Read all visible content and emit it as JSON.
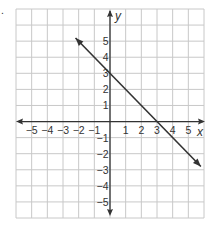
{
  "problem_marker": ".",
  "chart_data": {
    "type": "line",
    "title": "",
    "xlabel": "x",
    "ylabel": "y",
    "xlim": [
      -6,
      6
    ],
    "ylim": [
      -6,
      7
    ],
    "grid": true,
    "x_ticks": [
      -5,
      -4,
      -3,
      -2,
      -1,
      1,
      2,
      3,
      4,
      5
    ],
    "y_ticks": [
      -5,
      -4,
      -3,
      -2,
      -1,
      1,
      2,
      3,
      4,
      5
    ],
    "x_tick_labels": [
      "−5",
      "−4",
      "−3",
      "−2",
      "−1",
      "1",
      "2",
      "3",
      "4",
      "5"
    ],
    "y_tick_labels": [
      "5",
      "4",
      "3",
      "2",
      "1",
      "−1",
      "−2",
      "−3",
      "−4",
      "−5"
    ],
    "series": [
      {
        "name": "line",
        "equation": "y = -x + 3",
        "slope": -1,
        "y_intercept": 3,
        "x_intercept": 3,
        "x": [
          -2.2,
          0,
          3,
          5.8
        ],
        "y": [
          5.2,
          3,
          0,
          -2.8
        ],
        "arrows_both_ends": true,
        "color": "#333333"
      }
    ],
    "colors": {
      "grid": "#c8c8c8",
      "axis": "#333333",
      "background": "#ffffff"
    }
  }
}
